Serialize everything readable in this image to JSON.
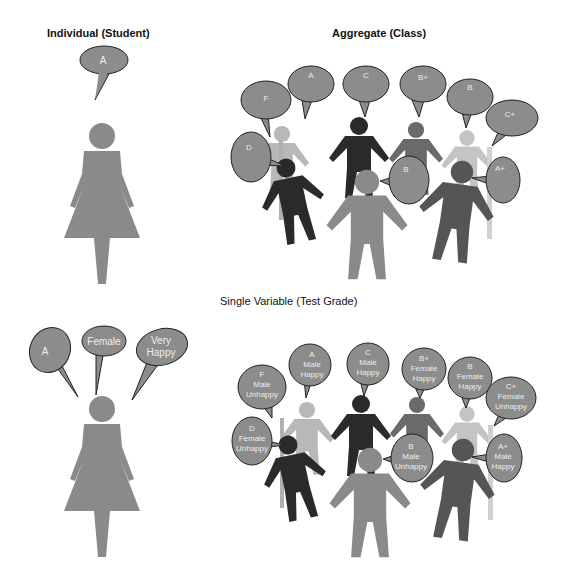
{
  "titles": {
    "individual": "Individual (Student)",
    "aggregate": "Aggregate (Class)",
    "single_variable": "Single Variable (Test Grade)"
  },
  "colors": {
    "bubble_fill": "#8c8c8c",
    "bubble_stroke": "#222222",
    "bubble_text": "#ececec",
    "figure_mid": "#8a8a8a",
    "figure_dark": "#2a2a2a",
    "figure_darkgray": "#555555",
    "figure_light": "#b8b8b8",
    "background": "#ffffff"
  },
  "individual_top": {
    "bubbles": [
      {
        "text": "A"
      }
    ]
  },
  "individual_bottom": {
    "bubbles": [
      {
        "lines": [
          "A"
        ]
      },
      {
        "lines": [
          "Female"
        ]
      },
      {
        "lines": [
          "Very",
          "Happy"
        ]
      }
    ]
  },
  "aggregate_top": {
    "bubbles": [
      {
        "lines": [
          "F"
        ]
      },
      {
        "lines": [
          "A"
        ]
      },
      {
        "lines": [
          "C"
        ]
      },
      {
        "lines": [
          "B+"
        ]
      },
      {
        "lines": [
          "B"
        ]
      },
      {
        "lines": [
          "C+"
        ]
      },
      {
        "lines": [
          "D"
        ]
      },
      {
        "lines": [
          "B"
        ]
      },
      {
        "lines": [
          "A+"
        ]
      }
    ]
  },
  "aggregate_bottom": {
    "bubbles": [
      {
        "lines": [
          "F",
          "Male",
          "Unhappy"
        ]
      },
      {
        "lines": [
          "A",
          "Male",
          "Happy"
        ]
      },
      {
        "lines": [
          "C",
          "Male",
          "Happy"
        ]
      },
      {
        "lines": [
          "B+",
          "Female",
          "Happy"
        ]
      },
      {
        "lines": [
          "B",
          "Female",
          "Happy"
        ]
      },
      {
        "lines": [
          "C+",
          "Female",
          "Unhappy"
        ]
      },
      {
        "lines": [
          "D",
          "Female",
          "Unhappy"
        ]
      },
      {
        "lines": [
          "B",
          "Male",
          "Unhappy"
        ]
      },
      {
        "lines": [
          "A+",
          "Male",
          "Happy"
        ]
      }
    ]
  }
}
